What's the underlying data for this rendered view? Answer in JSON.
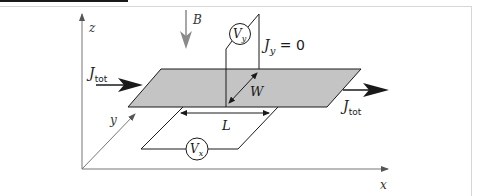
{
  "figure": {
    "axes": {
      "x_label": "x",
      "y_label": "y",
      "z_label": "z"
    },
    "field": {
      "label": "B"
    },
    "current": {
      "in_label_main": "J",
      "in_label_sub": "tot",
      "out_label_main": "J",
      "out_label_sub": "tot"
    },
    "transverse": {
      "label_main": "J",
      "label_sub": "y",
      "label_rest": " = 0"
    },
    "dimensions": {
      "width_label": "W",
      "length_label": "L"
    },
    "voltmeters": [
      {
        "name": "hall-voltmeter",
        "label_main": "V",
        "label_sub": "y"
      },
      {
        "name": "longitudinal-voltmeter",
        "label_main": "V",
        "label_sub": "x"
      }
    ],
    "colors": {
      "plate": "#c4c4c4",
      "axis": "#777777",
      "line": "#1a1a1a",
      "field_arrow": "#8a8a8a"
    }
  }
}
